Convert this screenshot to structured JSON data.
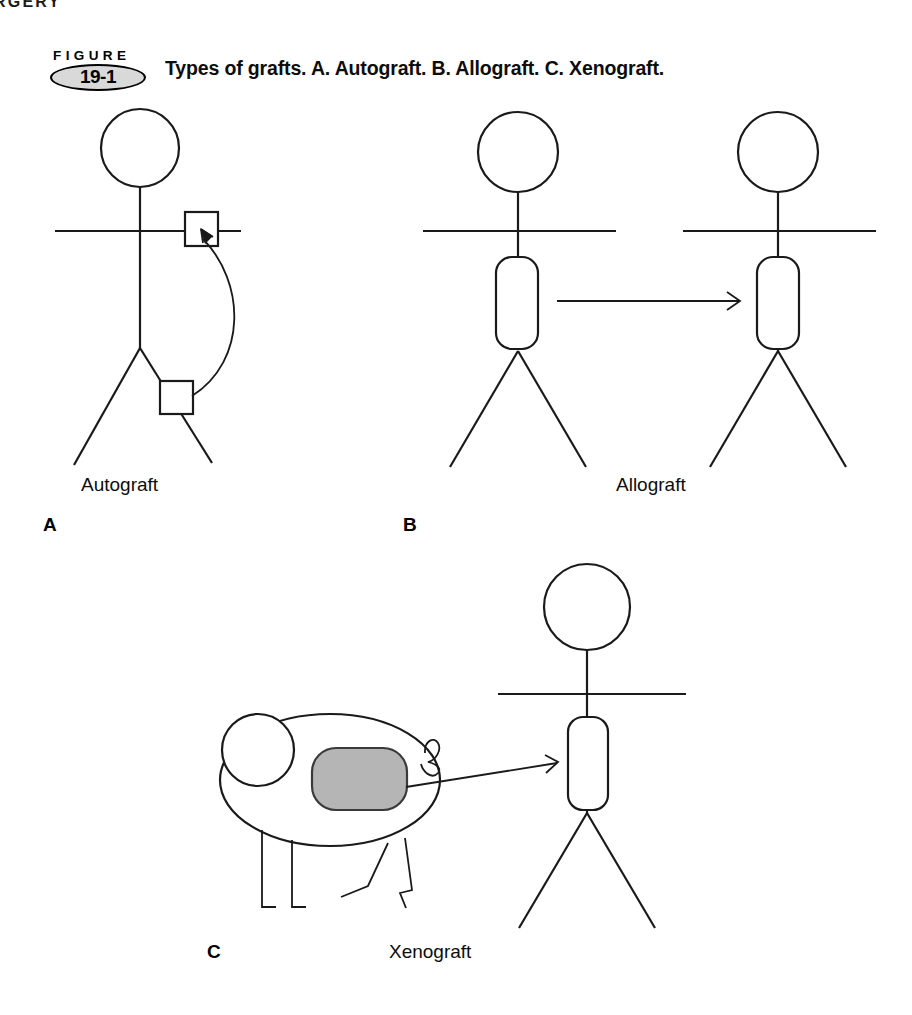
{
  "page": {
    "width": 912,
    "height": 1015,
    "background": "#ffffff",
    "ink": "#000000",
    "running_header": "RGERY"
  },
  "figure": {
    "badge_word": "FIGURE",
    "badge_number": "19-1",
    "badge_fill": "#d9d9d9",
    "caption": "Types of grafts. A. Autograft. B. Allograft. C. Xenograft."
  },
  "panels": [
    {
      "letter": "A",
      "label": "Autograft",
      "description": "Single human stick figure; tissue moved from thigh to shoulder on the same body",
      "graft_source": "self",
      "graft_recipient": "self"
    },
    {
      "letter": "B",
      "label": "Allograft",
      "description": "Two human stick figures; organ transferred from donor human to recipient human",
      "graft_source": "human donor",
      "graft_recipient": "human recipient"
    },
    {
      "letter": "C",
      "label": "Xenograft",
      "description": "Pig donor and human recipient; organ transferred from animal to human",
      "graft_source": "animal (pig)",
      "graft_recipient": "human recipient",
      "organ_fill": "#b5b5b5"
    }
  ],
  "diagram_data": {
    "type": "diagram",
    "title": "Types of grafts",
    "line_color": "#1a1a1a",
    "stroke_width": 2,
    "organ_fill_highlight": "#b5b5b5",
    "nodes": [
      {
        "id": "a-person",
        "panel": "A",
        "kind": "human-stick-figure",
        "x": 140,
        "y": 300
      },
      {
        "id": "a-graft-donor",
        "panel": "A",
        "kind": "square-graft-site",
        "x": 176,
        "y": 398
      },
      {
        "id": "a-graft-target",
        "panel": "A",
        "kind": "square-graft-site",
        "x": 201,
        "y": 229
      },
      {
        "id": "b-donor",
        "panel": "B",
        "kind": "human-stick-figure",
        "x": 518,
        "y": 250
      },
      {
        "id": "b-recipient",
        "panel": "B",
        "kind": "human-stick-figure",
        "x": 778,
        "y": 250
      },
      {
        "id": "b-donor-organ",
        "panel": "B",
        "kind": "rounded-rect-organ",
        "x": 517,
        "y": 302
      },
      {
        "id": "b-recip-organ",
        "panel": "B",
        "kind": "rounded-rect-organ",
        "x": 778,
        "y": 302
      },
      {
        "id": "c-pig",
        "panel": "C",
        "kind": "pig-figure",
        "x": 320,
        "y": 780
      },
      {
        "id": "c-pig-organ",
        "panel": "C",
        "kind": "rounded-rect-organ-filled",
        "x": 355,
        "y": 780
      },
      {
        "id": "c-human",
        "panel": "C",
        "kind": "human-stick-figure",
        "x": 587,
        "y": 720
      },
      {
        "id": "c-human-organ",
        "panel": "C",
        "kind": "rounded-rect-organ",
        "x": 588,
        "y": 763
      }
    ],
    "edges": [
      {
        "id": "a-arrow",
        "panel": "A",
        "from": "a-graft-donor",
        "to": "a-graft-target",
        "style": "curved-arrow"
      },
      {
        "id": "b-arrow",
        "panel": "B",
        "from": "b-donor-organ",
        "to": "b-recip-organ",
        "style": "straight-arrow"
      },
      {
        "id": "c-arrow",
        "panel": "C",
        "from": "c-pig-organ",
        "to": "c-human-organ",
        "style": "straight-arrow"
      }
    ]
  }
}
